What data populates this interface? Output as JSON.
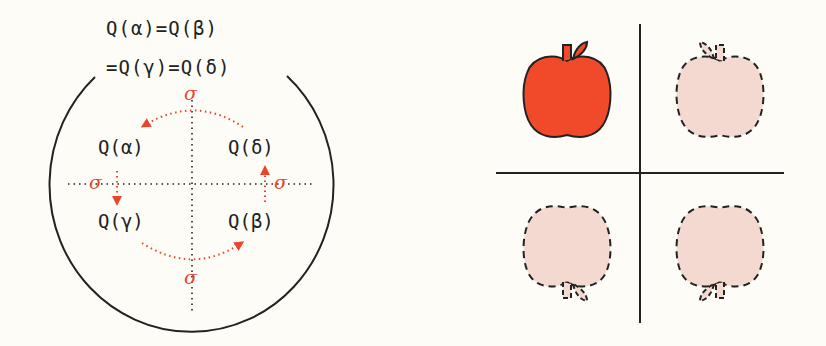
{
  "left": {
    "equation_line1": "Q(α)=Q(β)",
    "equation_line2": "=Q(γ)=Q(δ)",
    "nodes": {
      "top_left": "Q(α)",
      "top_right": "Q(δ)",
      "bottom_left": "Q(γ)",
      "bottom_right": "Q(β)"
    },
    "operator_symbol": "σ",
    "arrows": [
      {
        "from": "Q(δ)",
        "to": "Q(α)",
        "label": "σ"
      },
      {
        "from": "Q(α)",
        "to": "Q(γ)",
        "label": "σ"
      },
      {
        "from": "Q(γ)",
        "to": "Q(β)",
        "label": "σ"
      },
      {
        "from": "Q(β)",
        "to": "Q(δ)",
        "label": "σ"
      }
    ]
  },
  "right": {
    "quadrants": [
      {
        "position": "top-left",
        "object": "apple",
        "style": "solid",
        "orientation": "original"
      },
      {
        "position": "top-right",
        "object": "apple",
        "style": "dashed",
        "orientation": "mirrored horizontally"
      },
      {
        "position": "bottom-left",
        "object": "apple",
        "style": "dashed",
        "orientation": "flipped vertically"
      },
      {
        "position": "bottom-right",
        "object": "apple",
        "style": "dashed",
        "orientation": "rotated 180°"
      }
    ]
  },
  "colors": {
    "background": "#fdfcf6",
    "ink": "#222222",
    "accent_red": "#e8452c",
    "apple_fill": "#f04a2a",
    "ghost_fill": "#f3d9cf"
  }
}
